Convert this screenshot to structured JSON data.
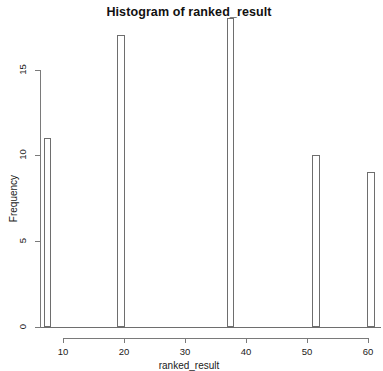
{
  "chart_data": {
    "type": "bar",
    "title": "Histogram of ranked_result",
    "xlabel": "ranked_result",
    "ylabel": "Frequency",
    "grid": false,
    "legend": null,
    "xlim": [
      6,
      62
    ],
    "ylim": [
      0,
      18
    ],
    "xticks": [
      10,
      20,
      30,
      40,
      50,
      60
    ],
    "xtick_labels": [
      "10",
      "20",
      "30",
      "40",
      "50",
      "60"
    ],
    "yticks": [
      0,
      5,
      10,
      15
    ],
    "ytick_labels": [
      "0",
      "5",
      "10",
      "15"
    ],
    "bin_width": 1.2,
    "categories": [
      "7.5",
      "19.5",
      "37.5",
      "51.5",
      "60.5"
    ],
    "x": [
      7.5,
      19.5,
      37.5,
      51.5,
      60.5
    ],
    "values": [
      11,
      17,
      18,
      10,
      9
    ],
    "bars": [
      {
        "label": "7.5",
        "x": 7.5,
        "frequency": 11
      },
      {
        "label": "19.5",
        "x": 19.5,
        "frequency": 17
      },
      {
        "label": "37.5",
        "x": 37.5,
        "frequency": 18
      },
      {
        "label": "51.5",
        "x": 51.5,
        "frequency": 10
      },
      {
        "label": "60.5",
        "x": 60.5,
        "frequency": 9
      }
    ],
    "colors": {
      "bar_fill": "#ffffff",
      "bar_stroke": "#6e6e6e",
      "axis": "#7a7a7a",
      "text": "#1a1a1a",
      "background": "#ffffff"
    }
  }
}
